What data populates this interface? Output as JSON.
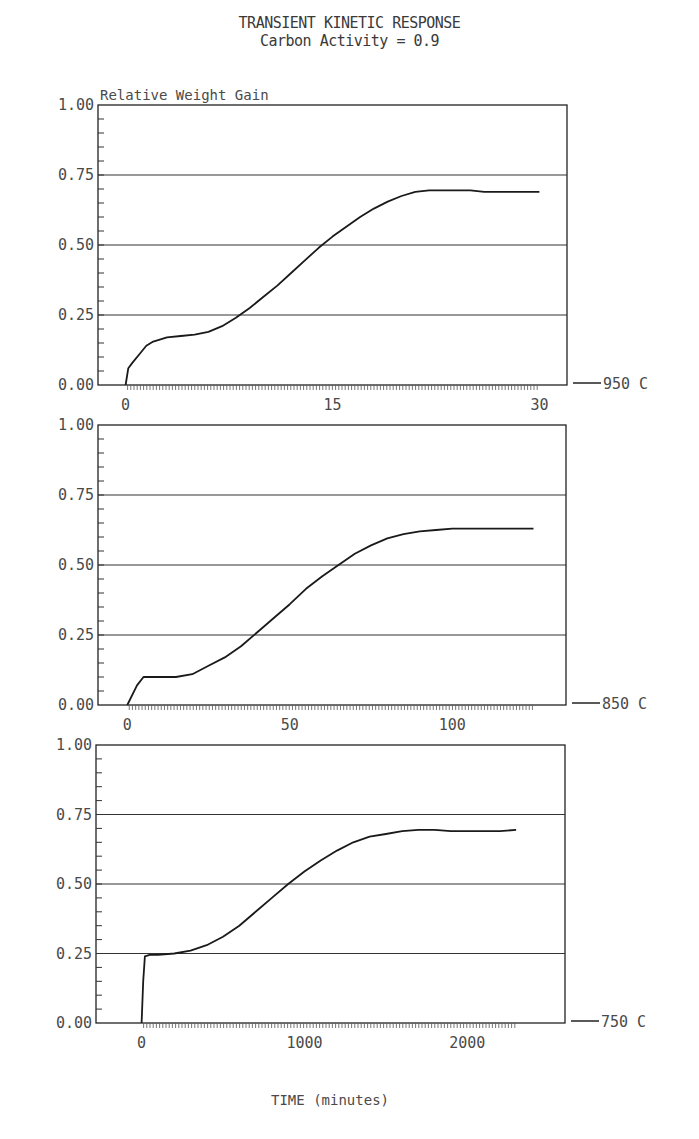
{
  "title": "TRANSIENT KINETIC RESPONSE",
  "subtitle": "Carbon Activity = 0.9",
  "ylabel": "Relative Weight Gain",
  "xlabel": "TIME (minutes)",
  "chart_data": [
    {
      "type": "line",
      "panel_label": "950 C",
      "title": "TRANSIENT KINETIC RESPONSE — Carbon Activity = 0.9",
      "xlabel": "TIME (minutes)",
      "ylabel": "Relative Weight Gain",
      "ylim": [
        0,
        1.0
      ],
      "xlim": [
        -2,
        32
      ],
      "x_ticks": [
        0,
        15,
        30
      ],
      "y_ticks": [
        "0.00",
        "0.25",
        "0.50",
        "0.75",
        "1.00"
      ],
      "grid": "horizontal at 0.25, 0.50, 0.75",
      "series": [
        {
          "name": "950 C",
          "x": [
            0,
            0.2,
            0.5,
            1,
            1.5,
            2,
            3,
            4,
            5,
            6,
            7,
            8,
            9,
            10,
            11,
            12,
            13,
            14,
            15,
            16,
            17,
            18,
            19,
            20,
            21,
            22,
            23,
            24,
            25,
            26,
            27,
            28,
            29,
            30
          ],
          "y": [
            0.0,
            0.06,
            0.08,
            0.11,
            0.14,
            0.155,
            0.17,
            0.175,
            0.18,
            0.19,
            0.21,
            0.24,
            0.275,
            0.315,
            0.355,
            0.4,
            0.445,
            0.49,
            0.53,
            0.565,
            0.6,
            0.63,
            0.655,
            0.675,
            0.69,
            0.695,
            0.695,
            0.695,
            0.695,
            0.69,
            0.69,
            0.69,
            0.69,
            0.69
          ]
        }
      ]
    },
    {
      "type": "line",
      "panel_label": "850 C",
      "ylim": [
        0,
        1.0
      ],
      "xlim": [
        -9,
        135
      ],
      "x_ticks": [
        0,
        50,
        100
      ],
      "y_ticks": [
        "0.00",
        "0.25",
        "0.50",
        "0.75",
        "1.00"
      ],
      "grid": "horizontal at 0.25, 0.50, 0.75",
      "series": [
        {
          "name": "850 C",
          "x": [
            0,
            3,
            5,
            10,
            15,
            20,
            25,
            30,
            35,
            40,
            45,
            50,
            55,
            60,
            65,
            70,
            75,
            80,
            85,
            90,
            95,
            100,
            105,
            110,
            115,
            120,
            125
          ],
          "y": [
            0.0,
            0.07,
            0.1,
            0.1,
            0.1,
            0.11,
            0.14,
            0.17,
            0.21,
            0.26,
            0.31,
            0.36,
            0.415,
            0.46,
            0.5,
            0.54,
            0.57,
            0.595,
            0.61,
            0.62,
            0.625,
            0.63,
            0.63,
            0.63,
            0.63,
            0.63,
            0.63
          ]
        }
      ]
    },
    {
      "type": "line",
      "panel_label": "750 C",
      "ylim": [
        0,
        1.0
      ],
      "xlim": [
        -280,
        2600
      ],
      "x_ticks": [
        0,
        1000,
        2000
      ],
      "y_ticks": [
        "0.00",
        "0.25",
        "0.50",
        "0.75",
        "1.00"
      ],
      "grid": "horizontal at 0.25, 0.50, 0.75",
      "series": [
        {
          "name": "750 C",
          "x": [
            0,
            10,
            20,
            50,
            100,
            200,
            300,
            400,
            500,
            600,
            700,
            800,
            900,
            1000,
            1100,
            1200,
            1300,
            1400,
            1500,
            1600,
            1700,
            1800,
            1900,
            2000,
            2100,
            2200,
            2300
          ],
          "y": [
            0.0,
            0.15,
            0.24,
            0.245,
            0.245,
            0.25,
            0.26,
            0.28,
            0.31,
            0.35,
            0.4,
            0.45,
            0.5,
            0.545,
            0.585,
            0.62,
            0.65,
            0.67,
            0.68,
            0.69,
            0.695,
            0.695,
            0.69,
            0.69,
            0.69,
            0.69,
            0.695
          ]
        }
      ]
    }
  ]
}
